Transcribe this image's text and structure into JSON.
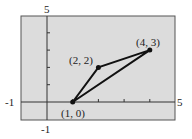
{
  "chart_data": {
    "type": "line",
    "title": "",
    "xlabel": "",
    "ylabel": "",
    "xlim": [
      -1,
      5
    ],
    "ylim": [
      -1,
      5
    ],
    "grid": false,
    "axis_labels": {
      "x_min": "-1",
      "x_max": "5",
      "y_min": "-1",
      "y_max": "5"
    },
    "series": [
      {
        "name": "triangle",
        "closed": true,
        "points": [
          [
            1,
            0
          ],
          [
            2,
            2
          ],
          [
            4,
            3
          ]
        ]
      }
    ],
    "point_labels": [
      "(1, 0)",
      "(2, 2)",
      "(4, 3)"
    ],
    "colors": {
      "background": "#d9d9d9",
      "line": "#111111",
      "frame": "#555555"
    }
  }
}
